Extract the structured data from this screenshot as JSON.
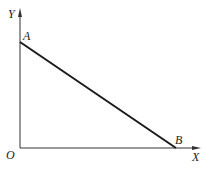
{
  "diagram": {
    "axes": {
      "x_label": "X",
      "y_label": "Y",
      "origin_label": "O"
    },
    "points": [
      {
        "name": "A",
        "label": "A"
      },
      {
        "name": "B",
        "label": "B"
      }
    ],
    "segment": "AB",
    "colors": {
      "line": "#1a1a1a",
      "axis": "#333333",
      "background": "#ffffff"
    }
  }
}
